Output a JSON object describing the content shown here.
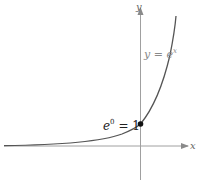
{
  "figure": {
    "type": "function-graph",
    "axes": {
      "x_label": "x",
      "y_label": "y",
      "axis_color": "#9a9a9a"
    },
    "curve": {
      "function": "e^x",
      "label_lhs": "y = e",
      "label_exp": "x",
      "label_color": "#8a8a8a",
      "curve_color": "#555555"
    },
    "point": {
      "label_base": "e",
      "label_exp": "0",
      "label_rhs": " = 1",
      "x": 0,
      "y": 1,
      "color": "#111111"
    }
  }
}
